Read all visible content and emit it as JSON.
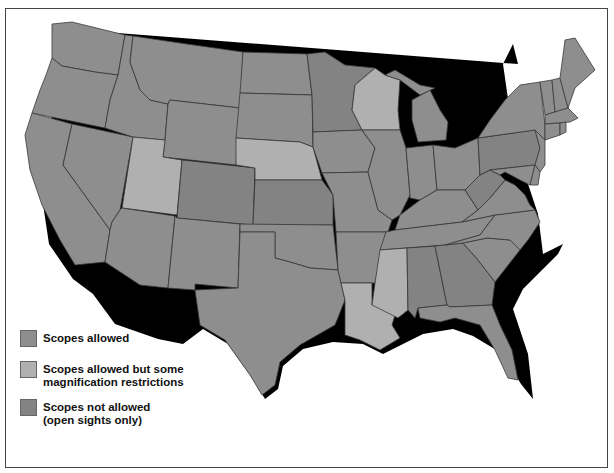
{
  "map": {
    "title": "",
    "colors": {
      "scopes_allowed": "#8e8e8e",
      "scopes_restricted": "#b0b0b0",
      "scopes_not_allowed": "#838383",
      "border": "#3a3a3a",
      "shadow": "#000000"
    },
    "states": [
      {
        "name": "Washington",
        "category": "scopes_allowed"
      },
      {
        "name": "Oregon",
        "category": "scopes_allowed"
      },
      {
        "name": "California",
        "category": "scopes_allowed"
      },
      {
        "name": "Idaho",
        "category": "scopes_allowed"
      },
      {
        "name": "Nevada",
        "category": "scopes_allowed"
      },
      {
        "name": "Montana",
        "category": "scopes_allowed"
      },
      {
        "name": "Wyoming",
        "category": "scopes_allowed"
      },
      {
        "name": "Utah",
        "category": "scopes_restricted"
      },
      {
        "name": "Arizona",
        "category": "scopes_allowed"
      },
      {
        "name": "Colorado",
        "category": "scopes_not_allowed"
      },
      {
        "name": "New Mexico",
        "category": "scopes_allowed"
      },
      {
        "name": "North Dakota",
        "category": "scopes_allowed"
      },
      {
        "name": "South Dakota",
        "category": "scopes_allowed"
      },
      {
        "name": "Nebraska",
        "category": "scopes_restricted"
      },
      {
        "name": "Kansas",
        "category": "scopes_not_allowed"
      },
      {
        "name": "Oklahoma",
        "category": "scopes_allowed"
      },
      {
        "name": "Texas",
        "category": "scopes_allowed"
      },
      {
        "name": "Minnesota",
        "category": "scopes_not_allowed"
      },
      {
        "name": "Iowa",
        "category": "scopes_allowed"
      },
      {
        "name": "Missouri",
        "category": "scopes_allowed"
      },
      {
        "name": "Arkansas",
        "category": "scopes_allowed"
      },
      {
        "name": "Louisiana",
        "category": "scopes_restricted"
      },
      {
        "name": "Wisconsin",
        "category": "scopes_restricted"
      },
      {
        "name": "Illinois",
        "category": "scopes_allowed"
      },
      {
        "name": "Mississippi",
        "category": "scopes_restricted"
      },
      {
        "name": "Michigan",
        "category": "scopes_allowed"
      },
      {
        "name": "Indiana",
        "category": "scopes_allowed"
      },
      {
        "name": "Ohio",
        "category": "scopes_allowed"
      },
      {
        "name": "Kentucky",
        "category": "scopes_allowed"
      },
      {
        "name": "Tennessee",
        "category": "scopes_allowed"
      },
      {
        "name": "Alabama",
        "category": "scopes_not_allowed"
      },
      {
        "name": "Georgia",
        "category": "scopes_not_allowed"
      },
      {
        "name": "Florida",
        "category": "scopes_allowed"
      },
      {
        "name": "South Carolina",
        "category": "scopes_allowed"
      },
      {
        "name": "North Carolina",
        "category": "scopes_allowed"
      },
      {
        "name": "Virginia",
        "category": "scopes_allowed"
      },
      {
        "name": "West Virginia",
        "category": "scopes_not_allowed"
      },
      {
        "name": "Pennsylvania",
        "category": "scopes_not_allowed"
      },
      {
        "name": "New York",
        "category": "scopes_allowed"
      },
      {
        "name": "Maryland",
        "category": "scopes_allowed"
      },
      {
        "name": "Delaware",
        "category": "scopes_allowed"
      },
      {
        "name": "New Jersey",
        "category": "scopes_allowed"
      },
      {
        "name": "Vermont",
        "category": "scopes_allowed"
      },
      {
        "name": "New Hampshire",
        "category": "scopes_allowed"
      },
      {
        "name": "Maine",
        "category": "scopes_allowed"
      },
      {
        "name": "Massachusetts",
        "category": "scopes_allowed"
      },
      {
        "name": "Connecticut",
        "category": "scopes_allowed"
      },
      {
        "name": "Rhode Island",
        "category": "scopes_allowed"
      }
    ]
  },
  "legend": {
    "items": [
      {
        "key": "scopes_allowed",
        "label_line1": "Scopes allowed",
        "label_line2": "",
        "color": "#8e8e8e"
      },
      {
        "key": "scopes_restricted",
        "label_line1": "Scopes allowed but some",
        "label_line2": "magnification restrictions",
        "color": "#b0b0b0"
      },
      {
        "key": "scopes_not_allowed",
        "label_line1": "Scopes not allowed",
        "label_line2": "(open sights only)",
        "color": "#838383"
      }
    ]
  }
}
